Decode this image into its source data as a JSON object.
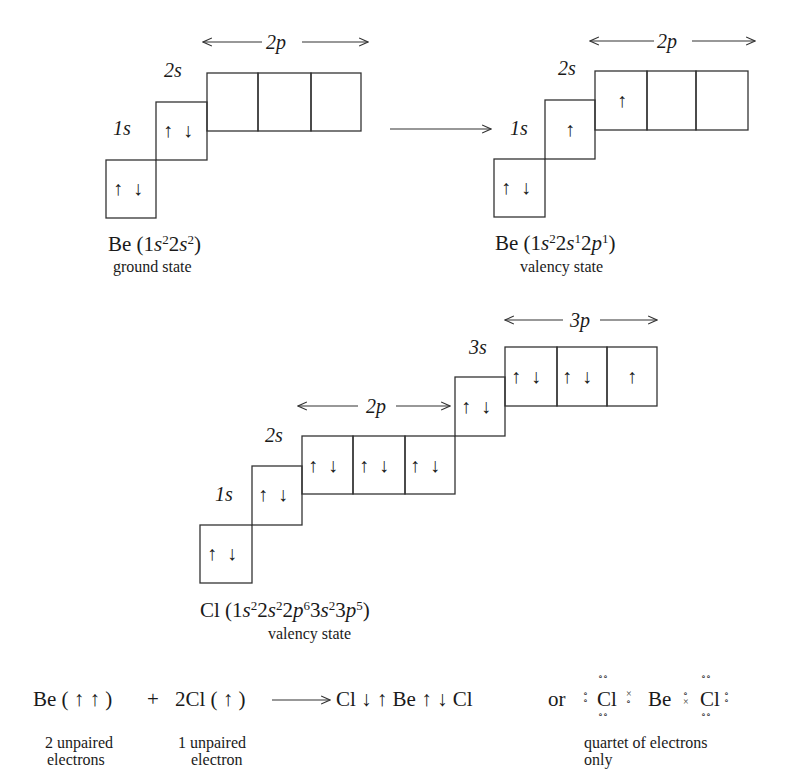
{
  "diagrams": {
    "be_ground": {
      "labels": {
        "s1": "1s",
        "s2": "2s",
        "p2": "2p"
      },
      "boxes": {
        "1s": [
          "↑",
          "↓"
        ],
        "2s": [
          "↑",
          "↓"
        ],
        "2p": [
          [],
          [],
          []
        ]
      },
      "formula": {
        "element": "Be",
        "config": "(1s²2s²)"
      },
      "state": "ground state"
    },
    "be_valency": {
      "labels": {
        "s1": "1s",
        "s2": "2s",
        "p2": "2p"
      },
      "boxes": {
        "1s": [
          "↑",
          "↓"
        ],
        "2s": [
          "↑"
        ],
        "2p": [
          [
            "↑"
          ],
          [],
          []
        ]
      },
      "formula": {
        "element": "Be",
        "config": "(1s²2s¹2p¹)"
      },
      "state": "valency state"
    },
    "cl_valency": {
      "labels": {
        "s1": "1s",
        "s2": "2s",
        "p2": "2p",
        "s3": "3s",
        "p3": "3p"
      },
      "boxes": {
        "1s": [
          "↑",
          "↓"
        ],
        "2s": [
          "↑",
          "↓"
        ],
        "2p": [
          [
            "↑",
            "↓"
          ],
          [
            "↑",
            "↓"
          ],
          [
            "↑",
            "↓"
          ]
        ],
        "3s": [
          "↑",
          "↓"
        ],
        "3p": [
          [
            "↑",
            "↓"
          ],
          [
            "↑",
            "↓"
          ],
          [
            "↑"
          ]
        ]
      },
      "formula": {
        "element": "Cl",
        "config": "(1s²2s²2p⁶3s²3p⁵)"
      },
      "state": "valency state"
    }
  },
  "equation": {
    "reactant1": "Be ( ↑ ↑ )",
    "plus": "+",
    "reactant2": "2Cl ( ↑ )",
    "product": "Cl ↓ ↑ Be ↑ ↓ Cl",
    "or": "or",
    "lewis": {
      "left": "Cl",
      "center": "Be",
      "right": "Cl"
    },
    "notes": {
      "reactant1": "2 unpaired electrons",
      "reactant1_lines": [
        "2 unpaired",
        "electrons"
      ],
      "reactant2_lines": [
        "1 unpaired",
        "electron"
      ],
      "lewis_lines": [
        "quartet of electrons",
        "only"
      ]
    }
  }
}
